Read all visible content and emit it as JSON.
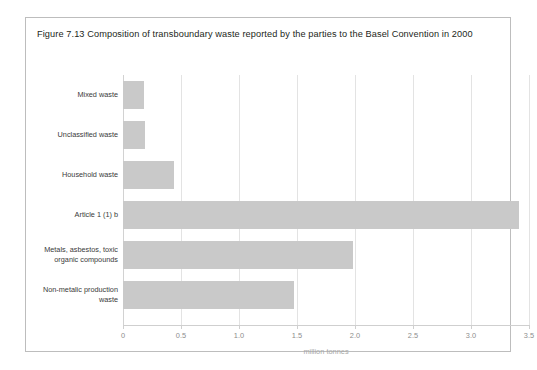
{
  "figure": {
    "title": "Figure 7.13 Composition of transboundary waste reported by the parties to the Basel Convention in 2000",
    "border_color": "#bdbdbd",
    "background": "#ffffff"
  },
  "chart_data": {
    "type": "bar",
    "orientation": "horizontal",
    "title": "Figure 7.13 Composition of transboundary waste reported by the parties to the Basel Convention in 2000",
    "xlabel": "million tonnes",
    "ylabel": "",
    "categories": [
      "Mixed waste",
      "Unclassified waste",
      "Household waste",
      "Article 1 (1) b",
      "Metals, asbestos, toxic organic compounds",
      "Non-metalic production waste"
    ],
    "values": [
      0.18,
      0.19,
      0.44,
      3.41,
      1.98,
      1.47
    ],
    "xlim": [
      0,
      3.5
    ],
    "xticks": [
      0,
      0.5,
      1.0,
      1.5,
      2.0,
      2.5,
      3.0,
      3.5
    ],
    "xtick_labels": [
      "0",
      "0.5",
      "1.0",
      "1.5",
      "2.0",
      "2.5",
      "3.0",
      "3.5"
    ],
    "grid": "vertical",
    "legend": "none",
    "bar_color": "#c9c9c9",
    "gridline_color": "#e3e3e3",
    "axis_color": "#cfcfcf",
    "tick_label_color": "#8d8d8d"
  }
}
